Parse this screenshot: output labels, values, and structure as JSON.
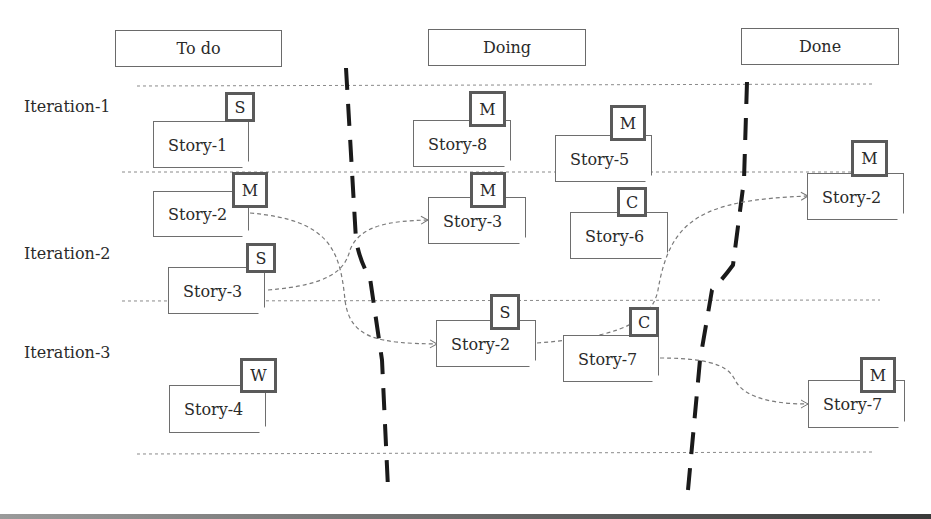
{
  "columns": [
    {
      "id": "todo",
      "label": "To do"
    },
    {
      "id": "doing",
      "label": "Doing"
    },
    {
      "id": "done",
      "label": "Done"
    }
  ],
  "iterations": [
    {
      "label": "Iteration-1"
    },
    {
      "label": "Iteration-2"
    },
    {
      "label": "Iteration-3"
    }
  ],
  "cards": [
    {
      "id": "todo-story-1",
      "label": "Story-1",
      "size": "S",
      "column": "To do",
      "iteration": "Iteration-1"
    },
    {
      "id": "todo-story-2",
      "label": "Story-2",
      "size": "M",
      "column": "To do",
      "iteration": "Iteration-2"
    },
    {
      "id": "todo-story-3",
      "label": "Story-3",
      "size": "S",
      "column": "To do",
      "iteration": "Iteration-2"
    },
    {
      "id": "todo-story-4",
      "label": "Story-4",
      "size": "W",
      "column": "To do",
      "iteration": "Iteration-3"
    },
    {
      "id": "doing-story-8",
      "label": "Story-8",
      "size": "M",
      "column": "Doing",
      "iteration": "Iteration-1"
    },
    {
      "id": "doing-story-5",
      "label": "Story-5",
      "size": "M",
      "column": "Doing",
      "iteration": "Iteration-1"
    },
    {
      "id": "doing-story-3",
      "label": "Story-3",
      "size": "M",
      "column": "Doing",
      "iteration": "Iteration-2"
    },
    {
      "id": "doing-story-6",
      "label": "Story-6",
      "size": "C",
      "column": "Doing",
      "iteration": "Iteration-2"
    },
    {
      "id": "doing-story-2",
      "label": "Story-2",
      "size": "S",
      "column": "Doing",
      "iteration": "Iteration-3"
    },
    {
      "id": "doing-story-7",
      "label": "Story-7",
      "size": "C",
      "column": "Doing",
      "iteration": "Iteration-3"
    },
    {
      "id": "done-story-2",
      "label": "Story-2",
      "size": "M",
      "column": "Done",
      "iteration": "Iteration-2"
    },
    {
      "id": "done-story-7",
      "label": "Story-7",
      "size": "M",
      "column": "Done",
      "iteration": "Iteration-3"
    }
  ],
  "moves": [
    {
      "from": "todo-story-2",
      "to": "doing-story-2"
    },
    {
      "from": "todo-story-3",
      "to": "doing-story-3"
    },
    {
      "from": "doing-story-2",
      "to": "done-story-2"
    },
    {
      "from": "doing-story-7",
      "to": "done-story-7"
    }
  ],
  "colors": {
    "border": "#6e6e6e",
    "tag_border": "#5a5a5a",
    "divider": "#1a1a1a",
    "guide": "#8a8a8a"
  }
}
